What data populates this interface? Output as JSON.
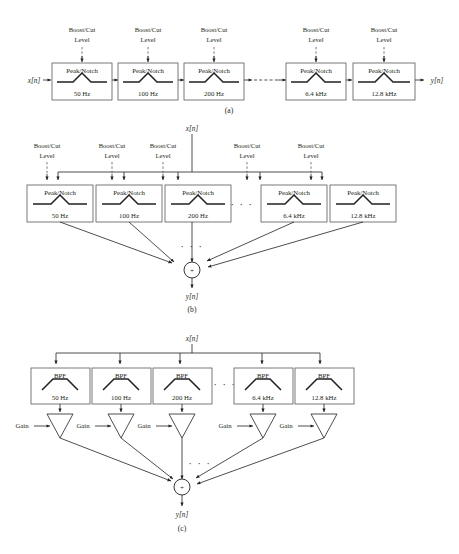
{
  "figure": {
    "type": "block-diagram",
    "bands": [
      {
        "freq": "50 Hz"
      },
      {
        "freq": "100 Hz"
      },
      {
        "freq": "200 Hz"
      },
      {
        "freq": "6.4 kHz"
      },
      {
        "freq": "12.8 kHz"
      }
    ],
    "ellipsis": "· · ·",
    "colors": {
      "ink": "#231f20",
      "box_stroke": "#58595b",
      "background": "#ffffff"
    }
  },
  "panel_a": {
    "label": "(a)",
    "input_signal": "x[n]",
    "output_signal": "y[n]",
    "block_title": "Peak/Notch",
    "control_line1": "Boost/Cut",
    "control_line2": "Level",
    "blocks": [
      {
        "title": "Peak/Notch",
        "freq": "50 Hz",
        "control1": "Boost/Cut",
        "control2": "Level"
      },
      {
        "title": "Peak/Notch",
        "freq": "100 Hz",
        "control1": "Boost/Cut",
        "control2": "Level"
      },
      {
        "title": "Peak/Notch",
        "freq": "200 Hz",
        "control1": "Boost/Cut",
        "control2": "Level"
      },
      {
        "title": "Peak/Notch",
        "freq": "6.4 kHz",
        "control1": "Boost/Cut",
        "control2": "Level"
      },
      {
        "title": "Peak/Notch",
        "freq": "12.8 kHz",
        "control1": "Boost/Cut",
        "control2": "Level"
      }
    ]
  },
  "panel_b": {
    "label": "(b)",
    "input_signal": "x[n]",
    "output_signal": "y[n]",
    "sum_symbol": "+",
    "ellipsis_row": "· · ·",
    "ellipsis_sum": "· · ·",
    "blocks": [
      {
        "title": "Peak/Notch",
        "freq": "50 Hz",
        "control1": "Boost/Cut",
        "control2": "Level"
      },
      {
        "title": "Peak/Notch",
        "freq": "100 Hz",
        "control1": "Boost/Cut",
        "control2": "Level"
      },
      {
        "title": "Peak/Notch",
        "freq": "200 Hz",
        "control1": "Boost/Cut",
        "control2": "Level"
      },
      {
        "title": "Peak/Notch",
        "freq": "6.4 kHz",
        "control1": "Boost/Cut",
        "control2": "Level"
      },
      {
        "title": "Peak/Notch",
        "freq": "12.8 kHz",
        "control1": "Boost/Cut",
        "control2": "Level"
      }
    ]
  },
  "panel_c": {
    "label": "(c)",
    "input_signal": "x[n]",
    "output_signal": "y[n]",
    "sum_symbol": "+",
    "gain_label": "Gain",
    "ellipsis_row": "· · ·",
    "ellipsis_sum": "· · ·",
    "blocks": [
      {
        "title": "BPF",
        "freq": "50 Hz",
        "gain": "Gain"
      },
      {
        "title": "BPF",
        "freq": "100 Hz",
        "gain": "Gain"
      },
      {
        "title": "BPF",
        "freq": "200 Hz",
        "gain": "Gain"
      },
      {
        "title": "BPF",
        "freq": "6.4 kHz",
        "gain": "Gain"
      },
      {
        "title": "BPF",
        "freq": "12.8 kHz",
        "gain": "Gain"
      }
    ]
  }
}
